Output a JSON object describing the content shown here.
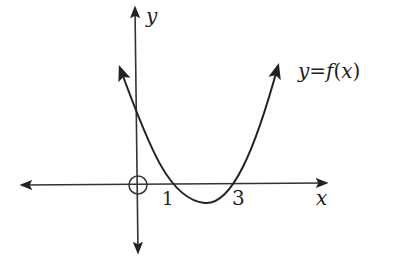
{
  "diagram": {
    "type": "function-graph",
    "axes": {
      "x_label": "x",
      "y_label": "y",
      "origin_label": "O"
    },
    "curve": {
      "label": "y = f(x)",
      "label_parts": {
        "y": "y",
        "eq": "=",
        "f": "f",
        "paren_open": "(",
        "x": "x",
        "paren_close": ")"
      },
      "shape": "upward parabola",
      "roots": [
        1,
        3
      ]
    },
    "ticks": {
      "root1": "1",
      "root2": "3"
    },
    "colors": {
      "ink": "#222222",
      "background": "#ffffff"
    }
  }
}
